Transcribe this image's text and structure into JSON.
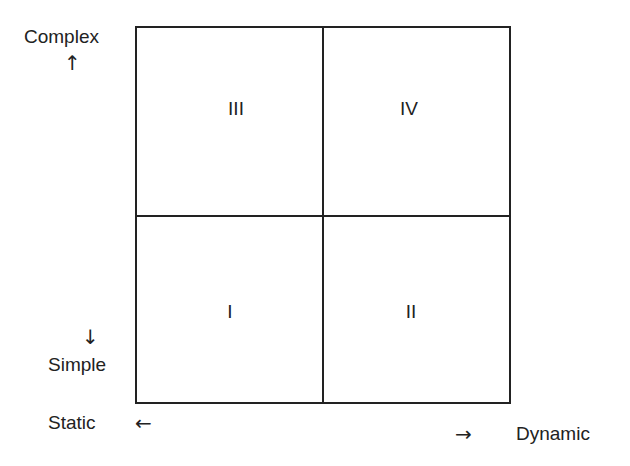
{
  "diagram": {
    "type": "2x2-matrix",
    "quadrants": {
      "top_left": "III",
      "top_right": "IV",
      "bottom_left": "I",
      "bottom_right": "II"
    },
    "y_axis": {
      "high_label": "Complex",
      "high_arrow": "↑",
      "low_label": "Simple",
      "low_arrow": "↓"
    },
    "x_axis": {
      "low_label": "Static",
      "low_arrow": "←",
      "high_label": "Dynamic",
      "high_arrow": "→"
    },
    "colors": {
      "line": "#222222",
      "text": "#222222",
      "background": "#ffffff"
    }
  }
}
